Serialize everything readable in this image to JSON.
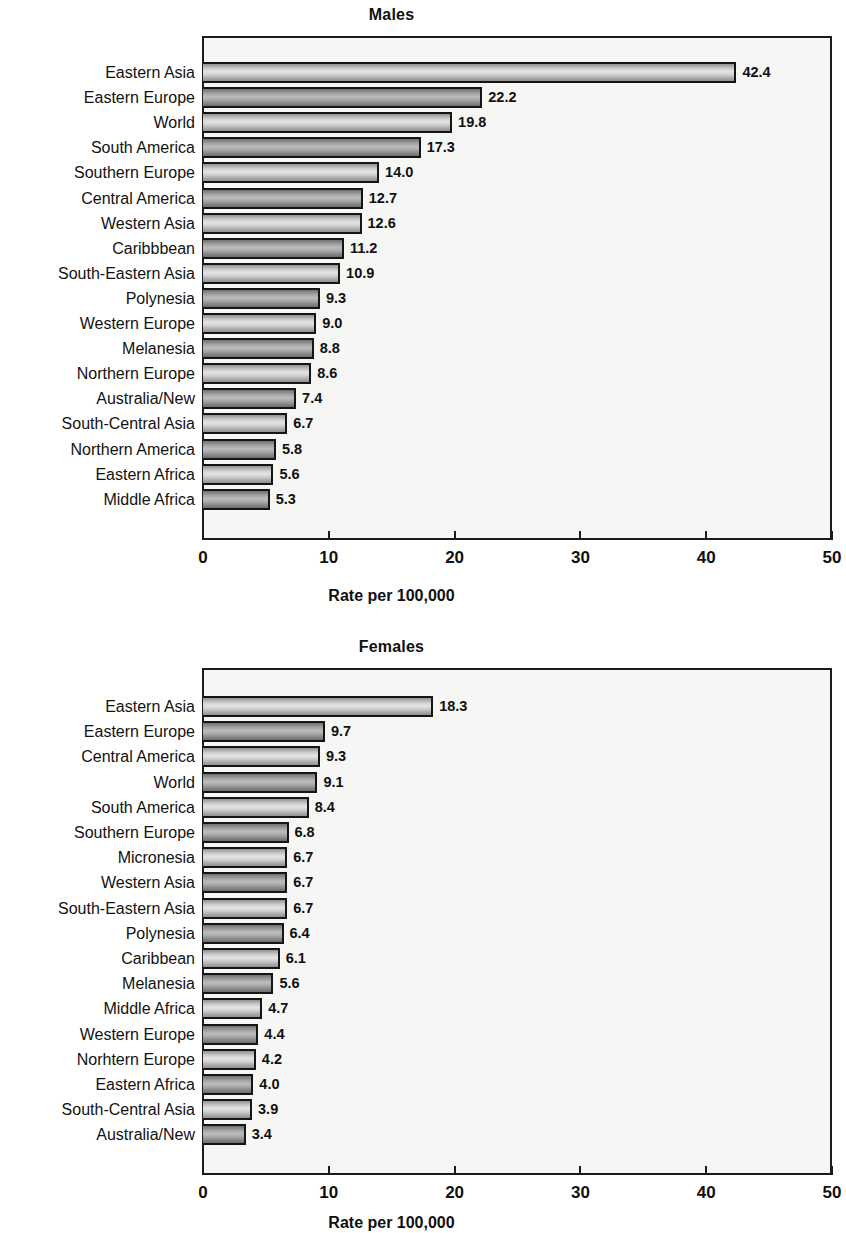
{
  "figure": {
    "axis_title": "Rate per 100,000",
    "x_ticks": [
      "0",
      "10",
      "20",
      "30",
      "40",
      "50"
    ]
  },
  "chart_data": [
    {
      "type": "bar",
      "orientation": "horizontal",
      "title": "Males",
      "xlabel": "Rate per 100,000",
      "ylabel": "",
      "xlim": [
        0,
        50
      ],
      "xticks": [
        0,
        10,
        20,
        30,
        40,
        50
      ],
      "grid": false,
      "legend": "none",
      "categories": [
        "Eastern Asia",
        "Eastern Europe",
        "World",
        "South America",
        "Southern Europe",
        "Central America",
        "Western Asia",
        "Caribbbean",
        "South-Eastern Asia",
        "Polynesia",
        "Western Europe",
        "Melanesia",
        "Northern Europe",
        "Australia/New",
        "South-Central Asia",
        "Northern America",
        "Eastern Africa",
        "Middle Africa"
      ],
      "values": [
        42.4,
        22.2,
        19.8,
        17.3,
        14.0,
        12.7,
        12.6,
        11.2,
        10.9,
        9.3,
        9.0,
        8.8,
        8.6,
        7.4,
        6.7,
        5.8,
        5.6,
        5.3
      ],
      "value_labels": [
        "42.4",
        "22.2",
        "19.8",
        "17.3",
        "14.0",
        "12.7",
        "12.6",
        "11.2",
        "10.9",
        "9.3",
        "9.0",
        "8.8",
        "8.6",
        "7.4",
        "6.7",
        "5.8",
        "5.6",
        "5.3"
      ]
    },
    {
      "type": "bar",
      "orientation": "horizontal",
      "title": "Females",
      "xlabel": "Rate per 100,000",
      "ylabel": "",
      "xlim": [
        0,
        50
      ],
      "xticks": [
        0,
        10,
        20,
        30,
        40,
        50
      ],
      "grid": false,
      "legend": "none",
      "categories": [
        "Eastern Asia",
        "Eastern Europe",
        "Central America",
        "World",
        "South America",
        "Southern Europe",
        "Micronesia",
        "Western Asia",
        "South-Eastern Asia",
        "Polynesia",
        "Caribbean",
        "Melanesia",
        "Middle Africa",
        "Western Europe",
        "Norhtern Europe",
        "Eastern Africa",
        "South-Central Asia",
        "Australia/New"
      ],
      "values": [
        18.3,
        9.7,
        9.3,
        9.1,
        8.4,
        6.8,
        6.7,
        6.7,
        6.7,
        6.4,
        6.1,
        5.6,
        4.7,
        4.4,
        4.2,
        4.0,
        3.9,
        3.4
      ],
      "value_labels": [
        "18.3",
        "9.7",
        "9.3",
        "9.1",
        "8.4",
        "6.8",
        "6.7",
        "6.7",
        "6.7",
        "6.4",
        "6.1",
        "5.6",
        "4.7",
        "4.4",
        "4.2",
        "4.0",
        "3.9",
        "3.4"
      ]
    }
  ]
}
